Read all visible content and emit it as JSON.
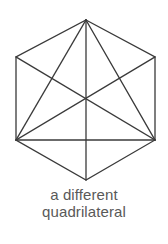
{
  "figure": {
    "caption_lines": [
      "a different",
      "quadrilateral"
    ],
    "caption_full": "a different quadrilateral",
    "background_color": "#ffffff",
    "stroke_color": "#3a3a3a",
    "caption_color": "#595959",
    "stroke_width": 1.3,
    "shape_name": "hexagon-with-chords",
    "vertices": [
      {
        "name": "top",
        "x": 86,
        "y": 20
      },
      {
        "name": "upper-right",
        "x": 155,
        "y": 57
      },
      {
        "name": "lower-right",
        "x": 155,
        "y": 140
      },
      {
        "name": "bottom",
        "x": 86,
        "y": 180
      },
      {
        "name": "lower-left",
        "x": 16,
        "y": 140
      },
      {
        "name": "upper-left",
        "x": 16,
        "y": 57
      }
    ],
    "outline_edges": [
      {
        "from": "top",
        "to": "upper-right"
      },
      {
        "from": "upper-right",
        "to": "lower-right"
      },
      {
        "from": "lower-right",
        "to": "bottom"
      },
      {
        "from": "bottom",
        "to": "lower-left"
      },
      {
        "from": "lower-left",
        "to": "upper-left"
      },
      {
        "from": "upper-left",
        "to": "top"
      }
    ],
    "chords": [
      {
        "name": "top-to-lower-left",
        "x1": 86,
        "y1": 20,
        "x2": 16,
        "y2": 140
      },
      {
        "name": "top-to-lower-right",
        "x1": 86,
        "y1": 20,
        "x2": 155,
        "y2": 140
      },
      {
        "name": "top-to-bottom-vertical",
        "x1": 86,
        "y1": 20,
        "x2": 86,
        "y2": 180
      },
      {
        "name": "lower-left-to-lower-right-horizontal",
        "x1": 16,
        "y1": 140,
        "x2": 155,
        "y2": 140
      },
      {
        "name": "lower-left-to-upper-right",
        "x1": 16,
        "y1": 140,
        "x2": 155,
        "y2": 57
      },
      {
        "name": "lower-right-to-upper-left",
        "x1": 155,
        "y1": 140,
        "x2": 16,
        "y2": 57
      }
    ],
    "center_point": {
      "x": 86,
      "y": 100
    }
  }
}
